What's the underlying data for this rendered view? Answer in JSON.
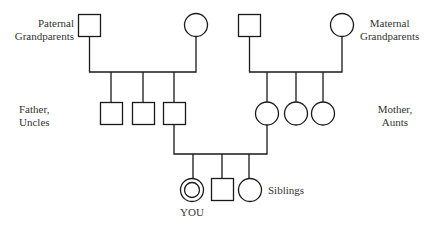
{
  "diagram": {
    "type": "pedigree",
    "line_color": "#1a1a1a",
    "labels": {
      "paternal": [
        "Paternal",
        "Grandparents"
      ],
      "maternal": [
        "Maternal",
        "Grandparents"
      ],
      "father": [
        "Father,",
        "Uncles"
      ],
      "mother": [
        "Mother,",
        "Aunts"
      ],
      "siblings": "Siblings",
      "you": "YOU"
    },
    "generations": [
      {
        "name": "grandparents",
        "members": [
          {
            "id": "paternal-grandfather",
            "shape": "square"
          },
          {
            "id": "paternal-grandmother",
            "shape": "circle"
          },
          {
            "id": "maternal-grandfather",
            "shape": "square"
          },
          {
            "id": "maternal-grandmother",
            "shape": "circle"
          }
        ]
      },
      {
        "name": "parents",
        "members": [
          {
            "id": "uncle-1",
            "shape": "square"
          },
          {
            "id": "uncle-2",
            "shape": "square"
          },
          {
            "id": "father",
            "shape": "square"
          },
          {
            "id": "mother",
            "shape": "circle"
          },
          {
            "id": "aunt-1",
            "shape": "circle"
          },
          {
            "id": "aunt-2",
            "shape": "circle"
          }
        ]
      },
      {
        "name": "siblings",
        "members": [
          {
            "id": "you",
            "shape": "double-circle"
          },
          {
            "id": "brother",
            "shape": "square"
          },
          {
            "id": "sister",
            "shape": "circle"
          }
        ]
      }
    ]
  }
}
